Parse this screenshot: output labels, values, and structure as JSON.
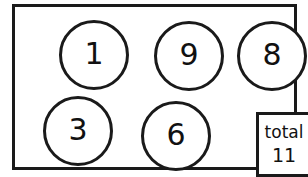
{
  "worksheet": {
    "name": "number-circles-total",
    "frame": {
      "border_color": "#1a1a1a"
    },
    "circles": [
      {
        "id": "circle-1",
        "value": "1",
        "row": "top",
        "position": 1
      },
      {
        "id": "circle-9",
        "value": "9",
        "row": "top",
        "position": 2
      },
      {
        "id": "circle-8",
        "value": "8",
        "row": "top",
        "position": 3
      },
      {
        "id": "circle-3",
        "value": "3",
        "row": "bottom",
        "position": 1
      },
      {
        "id": "circle-6",
        "value": "6",
        "row": "bottom",
        "position": 2
      }
    ],
    "total_box": {
      "label": "total",
      "value": "11"
    }
  },
  "chart_data": {
    "type": "diagram",
    "title": "",
    "categories": [
      "1",
      "9",
      "8",
      "3",
      "6"
    ],
    "values": [
      1,
      9,
      8,
      3,
      6
    ],
    "annotations": [
      {
        "label": "total",
        "value": 11
      }
    ]
  }
}
